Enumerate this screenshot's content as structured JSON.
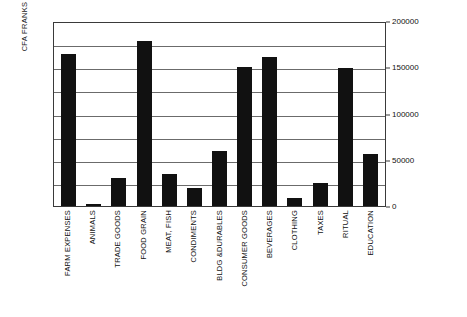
{
  "chart_data": {
    "type": "bar",
    "title": "",
    "subtitle": "",
    "xlabel": "",
    "ylabel": "CFA FRANKS",
    "ylim": [
      0,
      200000
    ],
    "ytick_labels": [
      "0",
      "50000",
      "100000",
      "150000",
      "200000"
    ],
    "ytick_values": [
      0,
      50000,
      100000,
      150000,
      200000
    ],
    "gridline_interval": 25000,
    "grid": true,
    "legend": false,
    "legend_position": "none",
    "bar_color": "#111111",
    "categories": [
      "FARM EXPENSES",
      "ANIMALS",
      "TRADE GOODS",
      "FOOD GRAIN",
      "MEAT, FISH",
      "CONDIMENTS",
      "BLDG &DURABLES",
      "CONSUMER GOODS",
      "BEVERAGES",
      "CLOTHING",
      "TAXES",
      "RITUAL",
      "EDUCATION"
    ],
    "values": [
      164000,
      2000,
      30000,
      178000,
      35000,
      19000,
      60000,
      150000,
      161000,
      9000,
      25000,
      149000,
      56000
    ]
  }
}
